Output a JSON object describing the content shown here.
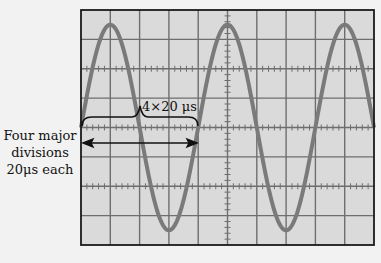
{
  "figure": {
    "side_label": {
      "line1": "Four major",
      "line2": "divisions",
      "line3": "20μs each"
    },
    "bracket_label": "4×20 μs",
    "colors": {
      "background": "#f2f2f2",
      "screen": "#dadada",
      "grid": "#6e6e6e",
      "border": "#1a1a1a",
      "trace": "#7a7a7a",
      "annotation": "#111111"
    },
    "grid": {
      "horizontal_divisions": 10,
      "vertical_divisions": 8
    }
  },
  "chart_data": {
    "type": "line",
    "xlabel": "time (20 μs/div)",
    "ylabel": "amplitude (div)",
    "x_divisions": 10,
    "y_divisions": 8,
    "period_divisions": 4,
    "period_us": 80,
    "amplitude_divisions": 3.5,
    "annotation": "4×20 μs",
    "grid": true
  }
}
